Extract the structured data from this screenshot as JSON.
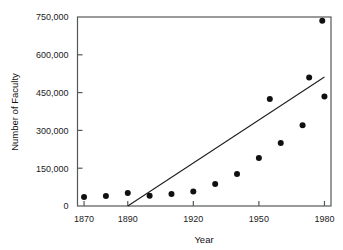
{
  "chart_data": {
    "type": "scatter",
    "title": "",
    "xlabel": "Year",
    "ylabel": "Number of Faculty",
    "xlim": [
      1867,
      1983
    ],
    "ylim": [
      0,
      750000
    ],
    "grid": false,
    "legend": null,
    "x_ticks": [
      1870,
      1890,
      1920,
      1950,
      1980
    ],
    "x_tick_labels": [
      "1870",
      "1890",
      "1920",
      "1950",
      "1980"
    ],
    "y_ticks": [
      0,
      150000,
      300000,
      450000,
      600000,
      750000
    ],
    "y_tick_labels": [
      "0",
      "150,000",
      "300,000",
      "450,000",
      "600,000",
      "750,000"
    ],
    "series": [
      {
        "name": "Number of Faculty",
        "marker": "filled-circle",
        "color": "#101010",
        "x": [
          1870,
          1880,
          1890,
          1900,
          1910,
          1920,
          1930,
          1940,
          1950,
          1960,
          1970,
          1980
        ],
        "values": [
          36000,
          40000,
          52000,
          41000,
          48000,
          58000,
          87000,
          127000,
          190000,
          250000,
          320000,
          435000
        ]
      }
    ],
    "points": [
      {
        "x": 1870,
        "y": 36000
      },
      {
        "x": 1880,
        "y": 40000
      },
      {
        "x": 1890,
        "y": 52000
      },
      {
        "x": 1900,
        "y": 41000
      },
      {
        "x": 1910,
        "y": 48000
      },
      {
        "x": 1920,
        "y": 58000
      },
      {
        "x": 1930,
        "y": 87000
      },
      {
        "x": 1940,
        "y": 127000
      },
      {
        "x": 1950,
        "y": 190000
      },
      {
        "x": 1960,
        "y": 250000
      },
      {
        "x": 1970,
        "y": 320000
      },
      {
        "x": 1980,
        "y": 435000
      }
    ],
    "extra_points": [
      {
        "x": 1955,
        "y": 425000
      },
      {
        "x": 1973,
        "y": 510000
      },
      {
        "x": 1979,
        "y": 735000
      }
    ],
    "trend_line": {
      "label": "fitted line",
      "color": "#1d1d1d",
      "from": {
        "x": 1890,
        "y": 0
      },
      "to": {
        "x": 1980,
        "y": 512000
      }
    },
    "annotations": []
  },
  "axes": {
    "x_title": "Year",
    "y_title": "Number of Faculty"
  }
}
